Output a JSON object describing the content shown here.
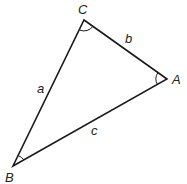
{
  "diagram": {
    "type": "triangle",
    "vertices": {
      "A": {
        "label": "A",
        "x": 167,
        "y": 79
      },
      "B": {
        "label": "B",
        "x": 13,
        "y": 166
      },
      "C": {
        "label": "C",
        "x": 84,
        "y": 20
      }
    },
    "sides": {
      "a": {
        "label": "a",
        "from": "B",
        "to": "C"
      },
      "b": {
        "label": "b",
        "from": "C",
        "to": "A"
      },
      "c": {
        "label": "c",
        "from": "A",
        "to": "B"
      }
    },
    "angle_marks": [
      "A",
      "B",
      "C"
    ],
    "line_color": "#1a1a1a"
  }
}
